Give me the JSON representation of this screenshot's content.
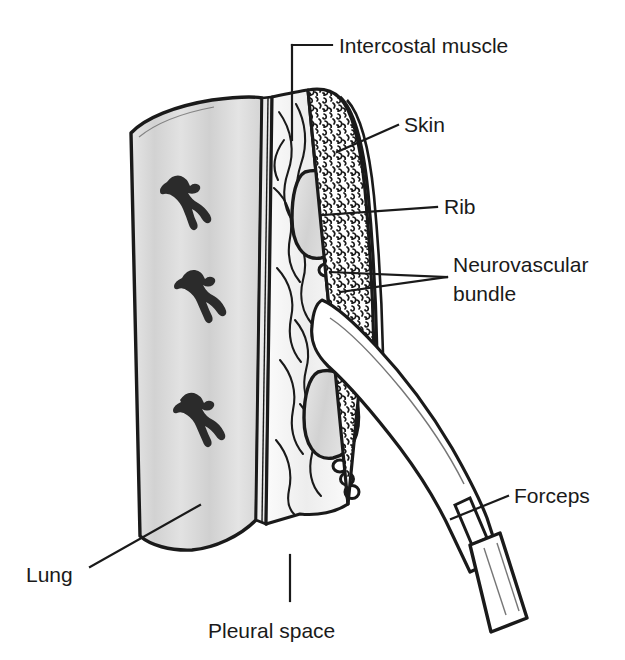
{
  "figure": {
    "background_color": "#ffffff",
    "ink_color": "#1a1a1a",
    "lung_fill": "#dcdcdc",
    "rib_fill": "#d9d9d9",
    "muscle_fill": "#ffffff",
    "instrument_fill": "#ffffff"
  },
  "labels": {
    "intercostal_muscle": "Intercostal muscle",
    "skin": "Skin",
    "rib": "Rib",
    "neurovascular_bundle_line1": "Neurovascular",
    "neurovascular_bundle_line2": "bundle",
    "forceps": "Forceps",
    "lung": "Lung",
    "pleural_space": "Pleural space"
  },
  "anatomy": {
    "layers": [
      "Lung",
      "Pleural space",
      "Intercostal muscle",
      "Rib",
      "Neurovascular bundle",
      "Skin"
    ],
    "vessel_count": 3,
    "neurovascular_vessel_groups": 2,
    "ribs_shown": 2
  },
  "instrument": {
    "name": "Forceps",
    "orientation": "diagonal through chest wall"
  }
}
